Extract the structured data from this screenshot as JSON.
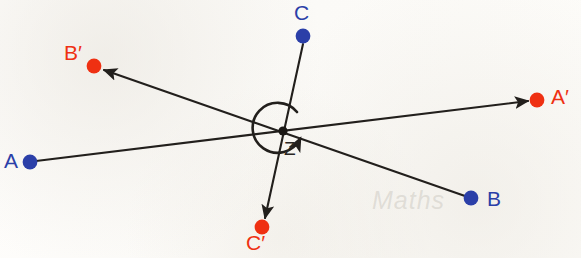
{
  "figure": {
    "background_color": "#fdfcfa",
    "watermark_text": "Maths",
    "colors": {
      "preimage_point": "#2b3fa8",
      "image_point": "#ef3012",
      "line": "#221f1c",
      "centre_point": "#1a1714"
    }
  },
  "centre": {
    "name": "Z",
    "label": "Z",
    "x": 283,
    "y": 131
  },
  "rotation_arc": {
    "name": "rotation-arc",
    "direction": "clockwise",
    "radius": 25,
    "description": "near-full circular arrow around centre Z indicating the turn"
  },
  "points": [
    {
      "id": "A",
      "label": "A",
      "kind": "preimage",
      "color": "#2b3fa8",
      "x": 30,
      "y": 162,
      "label_x": 4,
      "label_y": 154
    },
    {
      "id": "B",
      "label": "B",
      "kind": "preimage",
      "color": "#2b3fa8",
      "x": 471,
      "y": 198,
      "label_x": 487,
      "label_y": 192
    },
    {
      "id": "C",
      "label": "C",
      "kind": "preimage",
      "color": "#2b3fa8",
      "x": 303,
      "y": 36,
      "label_x": 296,
      "label_y": 4
    },
    {
      "id": "A'",
      "label": "A′",
      "kind": "image",
      "color": "#ef3012",
      "x": 537,
      "y": 100,
      "label_x": 552,
      "label_y": 87
    },
    {
      "id": "B'",
      "label": "B′",
      "kind": "image",
      "color": "#ef3012",
      "x": 94,
      "y": 66,
      "label_x": 66,
      "label_y": 44
    },
    {
      "id": "C'",
      "label": "C′",
      "kind": "image",
      "color": "#ef3012",
      "x": 262,
      "y": 227,
      "label_x": 248,
      "label_y": 234
    }
  ],
  "segments": [
    {
      "id": "A-to-A-prime",
      "from": "A",
      "to": "A'",
      "x1": 36,
      "y1": 161,
      "x2": 528,
      "y2": 101,
      "arrow": "end"
    },
    {
      "id": "B-to-B-prime",
      "from": "B",
      "to": "B'",
      "x1": 465,
      "y1": 196,
      "x2": 104,
      "y2": 70,
      "arrow": "end"
    },
    {
      "id": "C-to-C-prime",
      "from": "C",
      "to": "C'",
      "x1": 303,
      "y1": 44,
      "x2": 265,
      "y2": 218,
      "arrow": "end"
    }
  ]
}
